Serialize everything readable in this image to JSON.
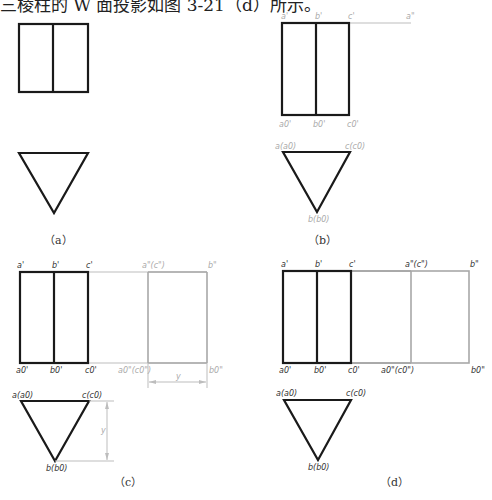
{
  "header": {
    "text": "三棱柱的 W 面投影如图 3-21（d）所示。"
  },
  "panels": {
    "a": {
      "caption": "（a）"
    },
    "b": {
      "caption": "（b）",
      "labels": {
        "a1": "a'",
        "b1": "b'",
        "c1": "c'",
        "a2": "a\"",
        "a0": "a0'",
        "b0": "b0'",
        "c0": "c0'",
        "a_top": "a(a0)",
        "c_top": "c(c0)",
        "b_bottom": "b(b0)"
      }
    },
    "c": {
      "caption": "（c）",
      "labels": {
        "a1": "a'",
        "b1": "b'",
        "c1": "c'",
        "ac2": "a\"(c\")",
        "b2": "b\"",
        "a0": "a0'",
        "b0": "b0'",
        "c0": "c0'",
        "ac0": "a0\"(c0\")",
        "b0w": "b0\"",
        "dim_y_h": "y",
        "dim_y_v": "y",
        "a_top": "a(a0)",
        "c_top": "c(c0)",
        "b_bottom": "b(b0)"
      }
    },
    "d": {
      "caption": "（d）",
      "labels": {
        "a1": "a'",
        "b1": "b'",
        "c1": "c'",
        "ac2": "a\"(c\")",
        "b2": "b\"",
        "a0": "a0'",
        "b0": "b0'",
        "c0": "c0'",
        "ac0": "a0\"(c0\")",
        "b0w": "b0\"",
        "a_top": "a(a0)",
        "c_top": "c(c0)",
        "b_bottom": "b(b0)"
      }
    }
  },
  "colors": {
    "thick_line": "#1a1a1a",
    "construction_line": "#bdbdbd",
    "grey_label": "#aaaaaa"
  }
}
